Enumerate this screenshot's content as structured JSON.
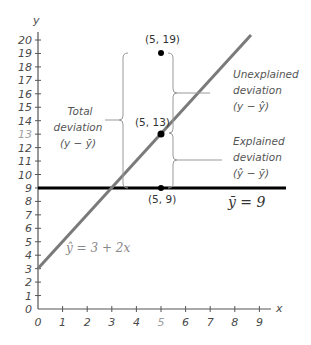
{
  "chart_data": {
    "type": "line",
    "title": "",
    "xlabel": "x",
    "ylabel": "y",
    "xlim": [
      0,
      9
    ],
    "ylim": [
      0,
      20
    ],
    "x_ticks": [
      "0",
      "1",
      "2",
      "3",
      "4",
      "5",
      "6",
      "7",
      "8",
      "9"
    ],
    "y_ticks": [
      "0",
      "1",
      "2",
      "3",
      "4",
      "5",
      "6",
      "7",
      "8",
      "9",
      "10",
      "11",
      "12",
      "13",
      "14",
      "15",
      "16",
      "17",
      "18",
      "19",
      "20"
    ],
    "highlighted_ticks": {
      "x": "5",
      "y": "13"
    },
    "grid": false,
    "series": [
      {
        "name": "Regression line",
        "equation": "ŷ = 3 + 2x",
        "intercept": 3,
        "slope": 2,
        "x": [
          0,
          8.8
        ],
        "y": [
          3,
          20.6
        ],
        "color": "#808080"
      },
      {
        "name": "Mean line",
        "equation": "ȳ = 9",
        "x": [
          0,
          10
        ],
        "y": [
          9,
          9
        ],
        "color": "#000000"
      }
    ],
    "points": [
      {
        "x": 5,
        "y": 19,
        "label": "(5, 19)"
      },
      {
        "x": 5,
        "y": 13,
        "label": "(5, 13)"
      },
      {
        "x": 5,
        "y": 9,
        "label": "(5, 9)"
      }
    ],
    "annotations": [
      {
        "text": [
          "Total",
          "deviation",
          "(y − ȳ)"
        ],
        "spans": [
          9,
          19
        ],
        "side": "left"
      },
      {
        "text": [
          "Unexplained",
          "deviation",
          "(y − ŷ)"
        ],
        "spans": [
          13,
          19
        ],
        "side": "right"
      },
      {
        "text": [
          "Explained",
          "deviation",
          "(ŷ − ȳ)"
        ],
        "spans": [
          9,
          13
        ],
        "side": "right"
      }
    ]
  },
  "labels": {
    "x_axis": "x",
    "y_axis": "y",
    "regression_eq": "ŷ = 3 + 2x",
    "mean_eq": "ȳ = 9",
    "p19": "(5, 19)",
    "p13": "(5, 13)",
    "p9": "(5, 9)",
    "total": [
      "Total",
      "deviation",
      "(y − ȳ)"
    ],
    "unexplained": [
      "Unexplained",
      "deviation",
      "(y − ŷ)"
    ],
    "explained": [
      "Explained",
      "deviation",
      "(ŷ − ȳ)"
    ]
  }
}
